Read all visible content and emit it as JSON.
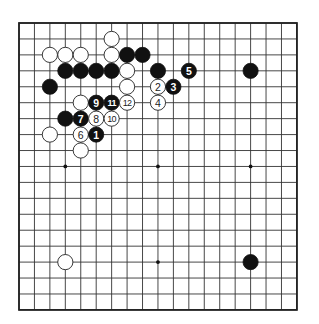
{
  "diagram": {
    "type": "go-board",
    "size": 19,
    "grid": {
      "left": 19,
      "top": 23,
      "dx": 15.44,
      "dy": 15.94,
      "stone_radius": 7.6
    },
    "colors": {
      "black": "#111111",
      "white": "#ffffff",
      "line": "#333333",
      "background": "#ffffff"
    },
    "star_points": [
      [
        3,
        3
      ],
      [
        3,
        9
      ],
      [
        3,
        15
      ],
      [
        9,
        3
      ],
      [
        9,
        9
      ],
      [
        9,
        15
      ],
      [
        15,
        3
      ],
      [
        15,
        9
      ],
      [
        15,
        15
      ]
    ],
    "stones": [
      {
        "col": 6,
        "row": 1,
        "color": "white",
        "label": ""
      },
      {
        "col": 2,
        "row": 2,
        "color": "white",
        "label": ""
      },
      {
        "col": 3,
        "row": 2,
        "color": "white",
        "label": ""
      },
      {
        "col": 4,
        "row": 2,
        "color": "white",
        "label": ""
      },
      {
        "col": 6,
        "row": 2,
        "color": "white",
        "label": ""
      },
      {
        "col": 7,
        "row": 2,
        "color": "black",
        "label": ""
      },
      {
        "col": 8,
        "row": 2,
        "color": "black",
        "label": ""
      },
      {
        "col": 3,
        "row": 3,
        "color": "black",
        "label": ""
      },
      {
        "col": 4,
        "row": 3,
        "color": "black",
        "label": ""
      },
      {
        "col": 5,
        "row": 3,
        "color": "black",
        "label": ""
      },
      {
        "col": 6,
        "row": 3,
        "color": "black",
        "label": ""
      },
      {
        "col": 7,
        "row": 3,
        "color": "white",
        "label": ""
      },
      {
        "col": 9,
        "row": 3,
        "color": "black",
        "label": ""
      },
      {
        "col": 11,
        "row": 3,
        "color": "black",
        "label": "5"
      },
      {
        "col": 15,
        "row": 3,
        "color": "black",
        "label": ""
      },
      {
        "col": 2,
        "row": 4,
        "color": "black",
        "label": ""
      },
      {
        "col": 7,
        "row": 4,
        "color": "white",
        "label": ""
      },
      {
        "col": 9,
        "row": 4,
        "color": "white",
        "label": "2"
      },
      {
        "col": 10,
        "row": 4,
        "color": "black",
        "label": "3"
      },
      {
        "col": 4,
        "row": 5,
        "color": "white",
        "label": ""
      },
      {
        "col": 5,
        "row": 5,
        "color": "black",
        "label": "9"
      },
      {
        "col": 6,
        "row": 5,
        "color": "black",
        "label": "11"
      },
      {
        "col": 7,
        "row": 5,
        "color": "white",
        "label": "12"
      },
      {
        "col": 9,
        "row": 5,
        "color": "white",
        "label": "4"
      },
      {
        "col": 3,
        "row": 6,
        "color": "black",
        "label": ""
      },
      {
        "col": 4,
        "row": 6,
        "color": "black",
        "label": "7"
      },
      {
        "col": 5,
        "row": 6,
        "color": "white",
        "label": "8"
      },
      {
        "col": 6,
        "row": 6,
        "color": "white",
        "label": "10"
      },
      {
        "col": 2,
        "row": 7,
        "color": "white",
        "label": ""
      },
      {
        "col": 4,
        "row": 7,
        "color": "white",
        "label": "6"
      },
      {
        "col": 5,
        "row": 7,
        "color": "black",
        "label": "1"
      },
      {
        "col": 4,
        "row": 8,
        "color": "white",
        "label": ""
      },
      {
        "col": 3,
        "row": 15,
        "color": "white",
        "label": ""
      },
      {
        "col": 15,
        "row": 15,
        "color": "black",
        "label": ""
      }
    ]
  }
}
